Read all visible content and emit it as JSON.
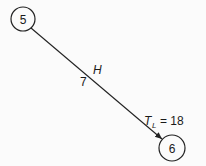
{
  "diagram": {
    "type": "activity-on-arrow network fragment",
    "nodes": [
      {
        "id": "5",
        "label": "5"
      },
      {
        "id": "6",
        "label": "6"
      }
    ],
    "edge": {
      "from": "5",
      "to": "6",
      "activity": "H",
      "duration": "7"
    },
    "annotation": {
      "symbol": "T",
      "subscript": "L",
      "text": "= 18"
    },
    "colors": {
      "stroke": "#222222",
      "background": "#fbfbfb"
    }
  }
}
